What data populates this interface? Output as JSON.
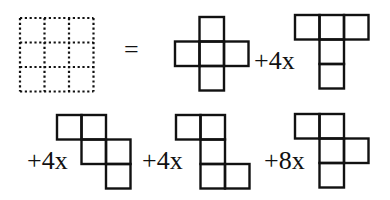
{
  "diagram": {
    "colors": {
      "stroke": "#111111",
      "background": "#ffffff"
    },
    "cell_size": 24.5,
    "equals_sign": "=",
    "grid": {
      "rows": 3,
      "cols": 3,
      "style": "dotted",
      "x": 20,
      "y": 18,
      "cell": 24.5
    },
    "terms": [
      {
        "label": "",
        "count": 1,
        "name": "cross-net",
        "origin": [
          175,
          17
        ],
        "cells": [
          [
            1,
            0
          ],
          [
            0,
            1
          ],
          [
            1,
            1
          ],
          [
            2,
            1
          ],
          [
            1,
            2
          ]
        ]
      },
      {
        "label": "+4x",
        "count": 4,
        "name": "t-net",
        "origin": [
          295,
          15
        ],
        "cells": [
          [
            0,
            0
          ],
          [
            1,
            0
          ],
          [
            2,
            0
          ],
          [
            1,
            1
          ],
          [
            1,
            2
          ]
        ],
        "label_pos": [
          254,
          69
        ]
      },
      {
        "label": "+4x",
        "count": 4,
        "name": "staircase-net",
        "origin": [
          57,
          115
        ],
        "cells": [
          [
            0,
            0
          ],
          [
            1,
            0
          ],
          [
            1,
            1
          ],
          [
            2,
            1
          ],
          [
            2,
            2
          ]
        ],
        "label_pos": [
          27,
          169
        ]
      },
      {
        "label": "+4x",
        "count": 4,
        "name": "s-l-net",
        "origin": [
          176,
          115
        ],
        "cells": [
          [
            0,
            0
          ],
          [
            1,
            0
          ],
          [
            1,
            1
          ],
          [
            1,
            2
          ],
          [
            2,
            2
          ]
        ],
        "label_pos": [
          142,
          169
        ]
      },
      {
        "label": "+8x",
        "count": 8,
        "name": "f-net",
        "origin": [
          295,
          114
        ],
        "cells": [
          [
            0,
            0
          ],
          [
            1,
            0
          ],
          [
            1,
            1
          ],
          [
            2,
            1
          ],
          [
            1,
            2
          ]
        ],
        "label_pos": [
          264,
          169
        ]
      }
    ]
  }
}
